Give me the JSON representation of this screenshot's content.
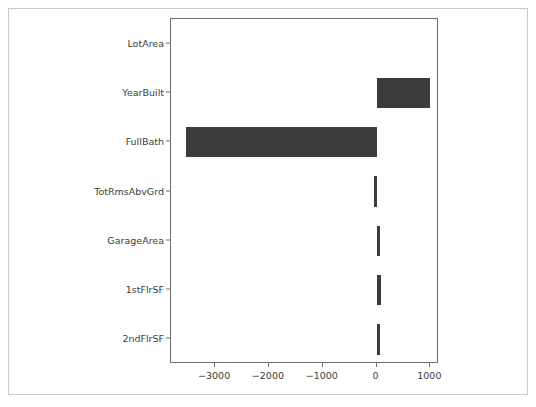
{
  "figure": {
    "background_color": "#ffffff",
    "frame_color": "#c9c9c9",
    "axes_color": "#6e6e6e",
    "bar_color": "#3b3b3b"
  },
  "chart_data": {
    "type": "bar",
    "orientation": "horizontal",
    "title": "",
    "xlabel": "",
    "ylabel": "",
    "categories": [
      "LotArea",
      "YearBuilt",
      "FullBath",
      "TotRmsAbvGrd",
      "GarageArea",
      "1stFlrSF",
      "2ndFlrSF"
    ],
    "values": [
      0,
      1000,
      -3540,
      -50,
      60,
      90,
      70
    ],
    "xlim": [
      -3820,
      1160
    ],
    "ylim_categories_top_to_bottom": true,
    "xticks": [
      -3000,
      -2000,
      -1000,
      0,
      1000
    ],
    "xticklabels": [
      "−3000",
      "−2000",
      "−1000",
      "0",
      "1000"
    ],
    "grid": false,
    "legend": null
  }
}
